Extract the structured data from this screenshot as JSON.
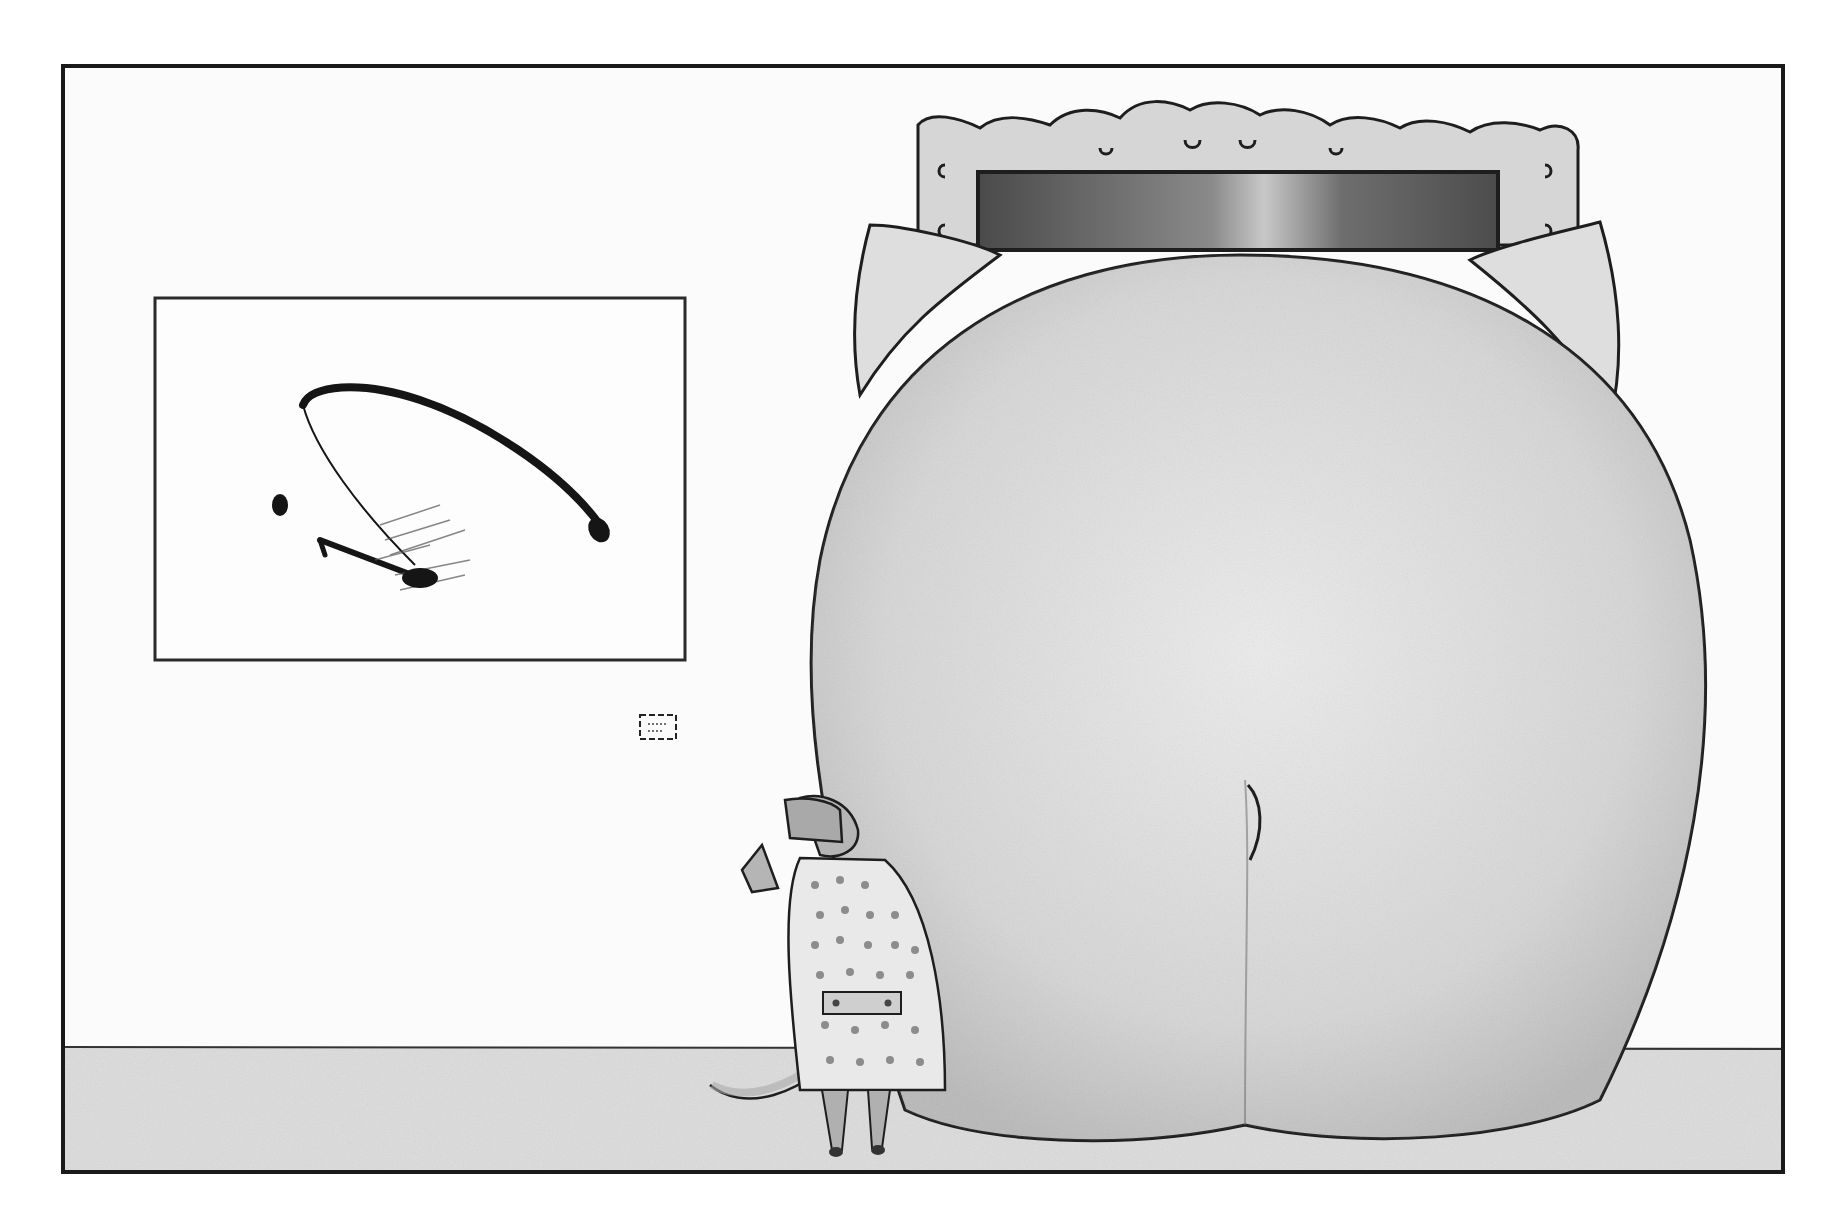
{
  "illustration": {
    "kind": "cartoon panel",
    "palette": {
      "paper": "#ffffff",
      "wall": "#fbfbfb",
      "floor": "#dcdcdc",
      "ink": "#1e1e1e",
      "elephant_body": "#d9d9d9",
      "elephant_shadow": "#b8b8b8",
      "frame_gilt": "#d6d6d6",
      "canvas_dark": "#5e5e5e",
      "coat": "#e9e9e9",
      "coat_spots": "#8c8c8c",
      "mouse_grey": "#a9a9a9"
    },
    "elements": {
      "panel_border": {
        "x": 63,
        "y": 66,
        "w": 1720,
        "h": 1106
      },
      "floor_line_y": 1047,
      "abstract_painting": {
        "x": 155,
        "y": 298,
        "w": 530,
        "h": 362,
        "label_present": true
      },
      "wall_label": {
        "x": 640,
        "y": 715,
        "w": 36,
        "h": 24,
        "text": ""
      },
      "ornate_frame": {
        "x": 915,
        "y": 110,
        "w": 665,
        "h": 150
      },
      "elephant": {
        "description": "elephant seen from behind, blocking a framed painting"
      },
      "mouse": {
        "description": "mouse in hat and trench coat viewing the art",
        "x": 710,
        "y": 790
      }
    }
  }
}
